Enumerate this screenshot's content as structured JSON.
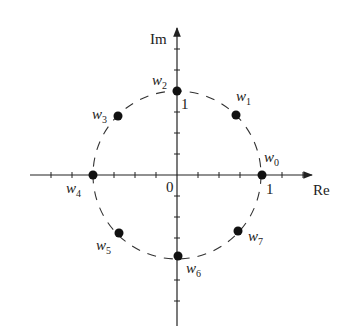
{
  "diagram": {
    "axes": {
      "real_label": "Re",
      "imag_label": "Im",
      "origin_label": "0",
      "real_unit_label": "1",
      "imag_unit_label": "1"
    },
    "circle": {
      "style": "dashed",
      "radius_units": 1
    },
    "points": [
      {
        "name": "w",
        "sub": "0",
        "angle_deg": 0
      },
      {
        "name": "w",
        "sub": "1",
        "angle_deg": 45
      },
      {
        "name": "w",
        "sub": "2",
        "angle_deg": 90
      },
      {
        "name": "w",
        "sub": "3",
        "angle_deg": 135
      },
      {
        "name": "w",
        "sub": "4",
        "angle_deg": 180
      },
      {
        "name": "w",
        "sub": "5",
        "angle_deg": 225
      },
      {
        "name": "w",
        "sub": "6",
        "angle_deg": 270
      },
      {
        "name": "w",
        "sub": "7",
        "angle_deg": 315
      }
    ],
    "colors": {
      "ink": "#222222",
      "background": "#ffffff"
    }
  }
}
